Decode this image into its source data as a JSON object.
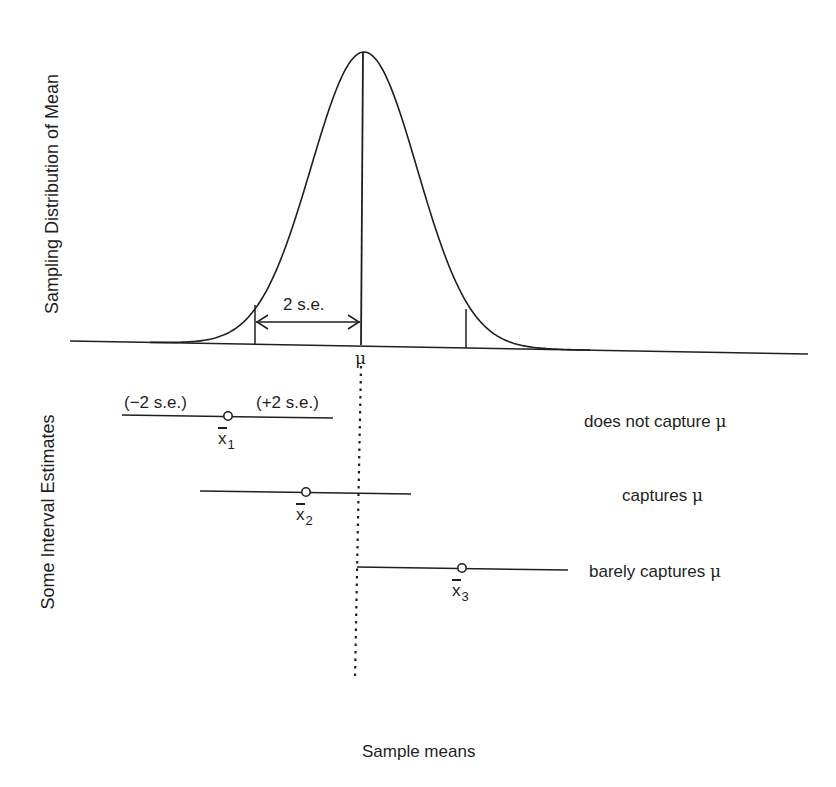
{
  "diagram": {
    "y_axis_top_label": "Sampling Distribution of Mean",
    "y_axis_bottom_label": "Some Interval Estimates",
    "x_axis_label": "Sample means",
    "distribution": {
      "type": "normal-curve",
      "mean_symbol": "μ",
      "two_se_label": "2 s.e."
    },
    "intervals": [
      {
        "estimate_symbol": "x",
        "subscript": "1",
        "left_label": "(−2 s.e.)",
        "right_label": "(+2 s.e.)",
        "outcome_text": "does not capture ",
        "outcome_symbol": "μ"
      },
      {
        "estimate_symbol": "x",
        "subscript": "2",
        "outcome_text": "captures ",
        "outcome_symbol": "μ"
      },
      {
        "estimate_symbol": "x",
        "subscript": "3",
        "outcome_text": "barely captures ",
        "outcome_symbol": "μ"
      }
    ],
    "colors": {
      "ink": "#1f1f1f",
      "background": "#ffffff"
    }
  }
}
